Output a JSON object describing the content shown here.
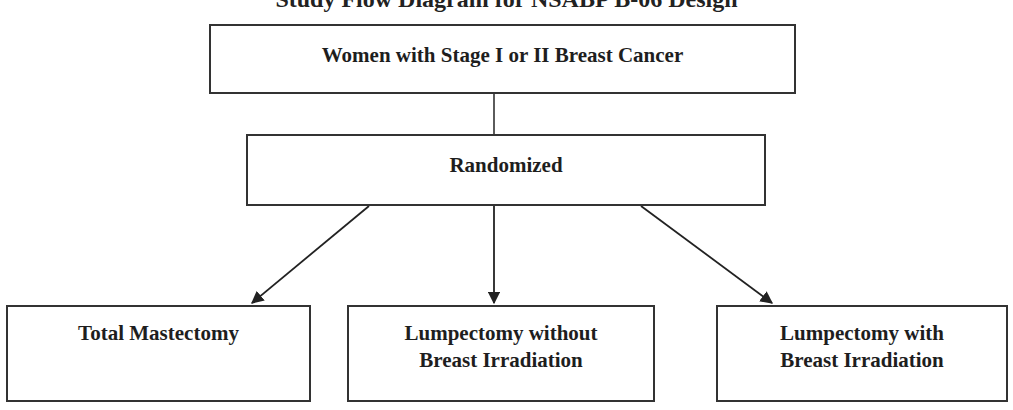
{
  "diagram": {
    "cut_title": "Study Flow Diagram for NSABP B-06 Design",
    "nodes": {
      "population": {
        "label": "Women with Stage I or II Breast Cancer"
      },
      "randomized": {
        "label": "Randomized"
      },
      "arm1": {
        "line1": "Total Mastectomy",
        "line2": ""
      },
      "arm2": {
        "line1": "Lumpectomy without",
        "line2": "Breast Irradiation"
      },
      "arm3": {
        "line1": "Lumpectomy with",
        "line2": "Breast Irradiation"
      }
    },
    "edges": [
      {
        "from": "population",
        "to": "randomized",
        "arrow": false
      },
      {
        "from": "randomized",
        "to": "arm1",
        "arrow": true
      },
      {
        "from": "randomized",
        "to": "arm2",
        "arrow": true
      },
      {
        "from": "randomized",
        "to": "arm3",
        "arrow": true
      }
    ],
    "colors": {
      "stroke": "#333333",
      "text": "#1e1e1e",
      "background": "#ffffff"
    }
  }
}
